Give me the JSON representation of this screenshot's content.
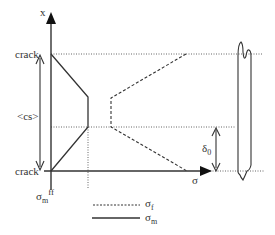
{
  "diagram": {
    "axes": {
      "x_axis_label": "x",
      "sigma_axis_label": "σ"
    },
    "labels": {
      "crack_top": "crack",
      "crack_bottom": "crack",
      "crack_spacing": "<cs>",
      "delta": "δ",
      "delta_sub": "0",
      "sigma_m_ff": "σ",
      "sigma_m_ff_sub": "m",
      "sigma_m_ff_sup": "ff"
    },
    "legend": [
      {
        "style": "dashed",
        "symbol": "σ",
        "sub": "f"
      },
      {
        "style": "solid",
        "symbol": "σ",
        "sub": "m"
      }
    ],
    "colors": {
      "line": "#333333",
      "dotted": "#666666"
    }
  }
}
